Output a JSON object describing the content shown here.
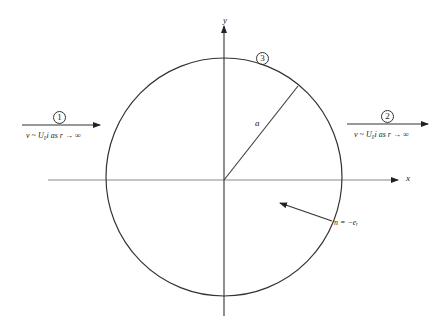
{
  "diagram": {
    "type": "flow past a circular cylinder",
    "axes": {
      "x_label": "x",
      "y_label": "y"
    },
    "radius_label": "a",
    "regions": [
      {
        "id": "region-1",
        "marker": "1",
        "condition": "v ~ U₀i  as  r → ∞"
      },
      {
        "id": "region-2",
        "marker": "2",
        "condition": "v ~ U₀i  as  r → ∞"
      },
      {
        "id": "region-3",
        "marker": "3"
      }
    ],
    "normal_label": "n = −eᵣ",
    "colors": {
      "lines": "#333333",
      "axes": "#888888",
      "background": "#ffffff"
    }
  }
}
